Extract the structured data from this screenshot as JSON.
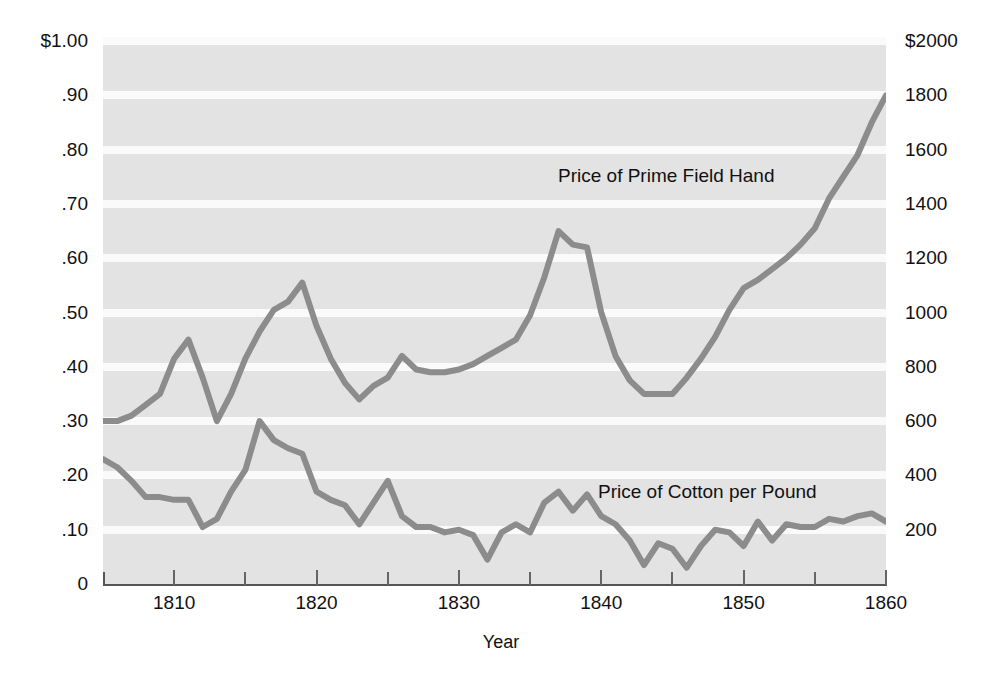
{
  "chart_data": {
    "type": "line",
    "title": "",
    "subtitle": "",
    "xlabel": "Year",
    "ylabel": "",
    "ylabel_right": "",
    "grid": true,
    "legend_position": "inline-annotations",
    "xlim": [
      1805,
      1860
    ],
    "xticks": [
      1810,
      1820,
      1830,
      1840,
      1850,
      1860
    ],
    "xtick_labels": [
      "1810",
      "1820",
      "1830",
      "1840",
      "1850",
      "1860"
    ],
    "xminor_ticks": [
      1815,
      1825,
      1835,
      1845,
      1855
    ],
    "left_axis": {
      "label": "",
      "ylim": [
        0,
        1.0
      ],
      "ticks": [
        1.0,
        0.9,
        0.8,
        0.7,
        0.6,
        0.5,
        0.4,
        0.3,
        0.2,
        0.1,
        0
      ],
      "tick_labels": [
        "$1.00",
        ".90",
        ".80",
        ".70",
        ".60",
        ".50",
        ".40",
        ".30",
        ".20",
        ".10",
        "0"
      ]
    },
    "right_axis": {
      "label": "",
      "ylim": [
        0,
        2000
      ],
      "ticks": [
        2000,
        1800,
        1600,
        1400,
        1200,
        1000,
        800,
        600,
        400,
        200
      ],
      "tick_labels": [
        "$2000",
        "1800",
        "1600",
        "1400",
        "1200",
        "1000",
        "800",
        "600",
        "400",
        "200"
      ]
    },
    "series": [
      {
        "name": "Price of Prime Field Hand",
        "axis": "right",
        "units": "dollars",
        "color": "#8c8c8c",
        "x": [
          1805,
          1806,
          1807,
          1808,
          1809,
          1810,
          1811,
          1812,
          1813,
          1814,
          1815,
          1816,
          1817,
          1818,
          1819,
          1820,
          1821,
          1822,
          1823,
          1824,
          1825,
          1826,
          1827,
          1828,
          1829,
          1830,
          1831,
          1832,
          1833,
          1834,
          1835,
          1836,
          1837,
          1838,
          1839,
          1840,
          1841,
          1842,
          1843,
          1844,
          1845,
          1846,
          1847,
          1848,
          1849,
          1850,
          1851,
          1852,
          1853,
          1854,
          1855,
          1856,
          1857,
          1858,
          1859,
          1860
        ],
        "values": [
          600,
          600,
          620,
          660,
          700,
          830,
          900,
          760,
          600,
          700,
          830,
          930,
          1010,
          1040,
          1110,
          950,
          830,
          740,
          680,
          730,
          760,
          840,
          790,
          780,
          780,
          790,
          810,
          840,
          870,
          900,
          990,
          1130,
          1300,
          1250,
          1240,
          1000,
          840,
          750,
          700,
          700,
          700,
          760,
          830,
          910,
          1010,
          1090,
          1120,
          1160,
          1200,
          1250,
          1310,
          1420,
          1500,
          1580,
          1700,
          1800
        ]
      },
      {
        "name": "Price of Cotton per Pound",
        "axis": "left",
        "units": "dollars per pound",
        "color": "#8c8c8c",
        "x": [
          1805,
          1806,
          1807,
          1808,
          1809,
          1810,
          1811,
          1812,
          1813,
          1814,
          1815,
          1816,
          1817,
          1818,
          1819,
          1820,
          1821,
          1822,
          1823,
          1824,
          1825,
          1826,
          1827,
          1828,
          1829,
          1830,
          1831,
          1832,
          1833,
          1834,
          1835,
          1836,
          1837,
          1838,
          1839,
          1840,
          1841,
          1842,
          1843,
          1844,
          1845,
          1846,
          1847,
          1848,
          1849,
          1850,
          1851,
          1852,
          1853,
          1854,
          1855,
          1856,
          1857,
          1858,
          1859,
          1860
        ],
        "values": [
          0.23,
          0.215,
          0.19,
          0.16,
          0.16,
          0.155,
          0.155,
          0.105,
          0.12,
          0.17,
          0.21,
          0.3,
          0.265,
          0.25,
          0.24,
          0.17,
          0.155,
          0.145,
          0.11,
          0.15,
          0.19,
          0.125,
          0.105,
          0.105,
          0.095,
          0.1,
          0.09,
          0.045,
          0.095,
          0.11,
          0.095,
          0.15,
          0.17,
          0.135,
          0.165,
          0.125,
          0.11,
          0.08,
          0.035,
          0.075,
          0.065,
          0.03,
          0.07,
          0.1,
          0.095,
          0.07,
          0.115,
          0.08,
          0.11,
          0.105,
          0.105,
          0.12,
          0.115,
          0.125,
          0.13,
          0.115
        ]
      }
    ],
    "annotations": [
      {
        "id": "hand",
        "text": "Price of Prime Field Hand"
      },
      {
        "id": "cotton",
        "text": "Price of Cotton per Pound"
      }
    ],
    "colors": {
      "plot_background": "#e3e3e3",
      "gridline": "#fafafa",
      "line": "#8c8c8c",
      "axis": "#555555",
      "text": "#111111",
      "page_background": "#ffffff"
    }
  }
}
